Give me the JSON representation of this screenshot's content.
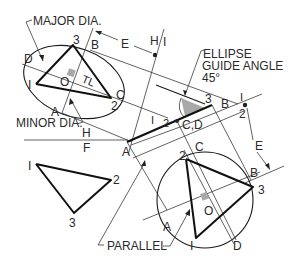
{
  "figure": {
    "type": "descriptive geometry construction"
  },
  "labels": {
    "major_dia": "MAJOR DIA.",
    "minor_dia": "MINOR DIA.",
    "ellipse_guide_1": "ELLIPSE",
    "ellipse_guide_2": "GUIDE ANGLE",
    "ellipse_guide_3": "45°",
    "parallel": "PARALLEL",
    "tl": "TL",
    "fold_h_top": "H",
    "fold_f_bottom": "F",
    "fold_h2": "H",
    "fold_1": "I",
    "dim_e": "E",
    "dim_e2": "E"
  },
  "ellipse_view": {
    "points": {
      "p1": "I",
      "p2": "2",
      "p3": "3"
    },
    "letters": {
      "a": "A",
      "b": "B",
      "c": "C",
      "d": "D",
      "o": "O"
    }
  },
  "edge_view": {
    "points": {
      "p3": "3",
      "b": "B",
      "p1": "I",
      "p2": "2",
      "cd": "C,D",
      "a": "A",
      "r1": "I",
      "r2": "2"
    }
  },
  "front_view": {
    "points": {
      "p1": "I",
      "p2": "2",
      "p3": "3"
    }
  },
  "circle_view": {
    "points": {
      "p1": "I",
      "p2": "2",
      "p3": "3"
    },
    "letters": {
      "a": "A",
      "b": "B",
      "c": "C",
      "d": "D",
      "o": "O"
    }
  },
  "colors": {
    "line": "#1a1a1a",
    "shade": "#a8a8a8",
    "background": "#ffffff"
  }
}
